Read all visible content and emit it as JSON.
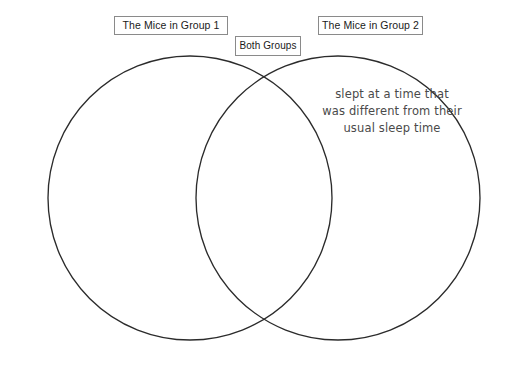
{
  "canvas": {
    "width": 522,
    "height": 365,
    "background": "#ffffff"
  },
  "diagram": {
    "type": "venn-two-set",
    "stroke_color": "#2b2b2b",
    "left_circle": {
      "cx": 190,
      "cy": 198,
      "r": 142
    },
    "right_circle": {
      "cx": 338,
      "cy": 198,
      "r": 142
    }
  },
  "labels": {
    "group1": "The Mice in Group 1",
    "both": "Both Groups",
    "group2": "The Mice in Group 2"
  },
  "entries": {
    "left_only": "",
    "overlap": "",
    "right_only": "slept at a time that\nwas different from their\nusual sleep time"
  }
}
